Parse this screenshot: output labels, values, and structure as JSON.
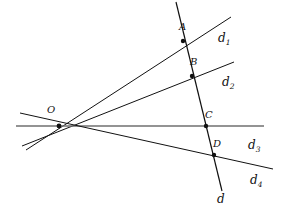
{
  "figure": {
    "background_color": "#ffffff",
    "ink_color": "#111111",
    "horizontal_line_color": "#6f6f6f"
  },
  "vertex": {
    "name": "O",
    "label": "O",
    "x": 59,
    "y": 126,
    "label_x": 47,
    "label_y": 113
  },
  "points": [
    {
      "label": "A",
      "x": 183,
      "y": 41,
      "label_x": 179,
      "label_y": 30,
      "on_line": "d1"
    },
    {
      "label": "B",
      "x": 192,
      "y": 76,
      "label_x": 190,
      "label_y": 65,
      "on_line": "d2"
    },
    {
      "label": "C",
      "x": 206,
      "y": 126,
      "label_x": 205,
      "label_y": 118,
      "on_line": "d3"
    },
    {
      "label": "D",
      "x": 214,
      "y": 155,
      "label_x": 213,
      "label_y": 147,
      "on_line": "d4"
    }
  ],
  "lines": [
    {
      "id": "d1",
      "label": "d",
      "subscript": "1",
      "x1": 26,
      "y1": 150,
      "x2": 231,
      "y2": 17,
      "color": "#111111",
      "width": 1,
      "label_x": 218,
      "label_y": 42
    },
    {
      "id": "d2",
      "label": "d",
      "subscript": "2",
      "x1": 22,
      "y1": 146,
      "x2": 234,
      "y2": 62,
      "color": "#111111",
      "width": 1,
      "label_x": 222,
      "label_y": 86
    },
    {
      "id": "d3",
      "label": "d",
      "subscript": "3",
      "x1": 16,
      "y1": 126,
      "x2": 264,
      "y2": 126,
      "color": "#6f6f6f",
      "width": 1.4,
      "label_x": 248,
      "label_y": 149
    },
    {
      "id": "d4",
      "label": "d",
      "subscript": "4",
      "x1": 20,
      "y1": 113,
      "x2": 273,
      "y2": 169,
      "color": "#111111",
      "width": 1,
      "label_x": 250,
      "label_y": 184
    }
  ],
  "transversal": {
    "id": "d",
    "label": "d",
    "subscript": "",
    "x1": 176,
    "y1": 2,
    "x2": 222,
    "y2": 191,
    "color": "#111111",
    "width": 1.2,
    "label_x": 217,
    "label_y": 203
  }
}
